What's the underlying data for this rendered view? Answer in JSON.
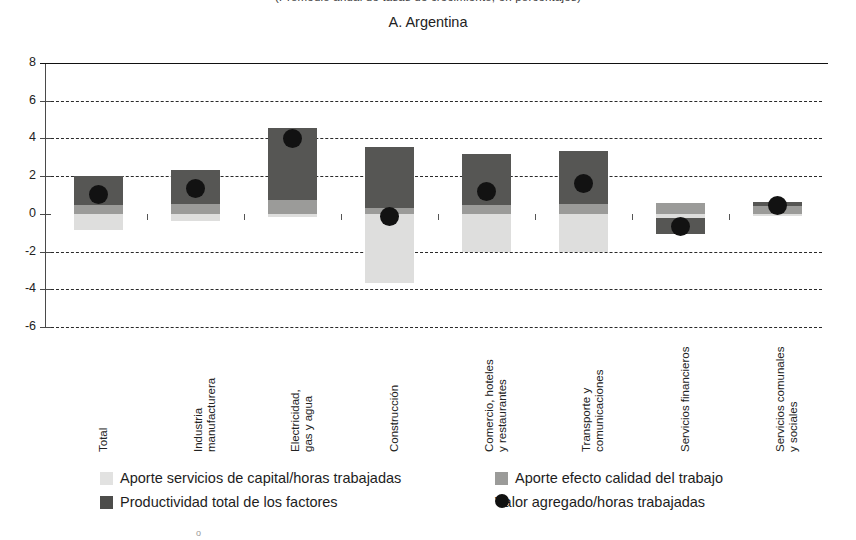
{
  "supertitle": "(Promedio anual de tasas de crecimiento, en porcentajes)",
  "panel_title": "A. Argentina",
  "axis": {
    "y_ticks": [
      "8",
      "6",
      "4",
      "2",
      "0",
      "-2",
      "-4",
      "-6"
    ],
    "y_min": -6,
    "y_max": 8,
    "y_step": 2
  },
  "legend": {
    "cap": "Aporte servicios de capital/horas trabajadas",
    "qual": "Aporte efecto calidad del trabajo",
    "tfp": "Productividad total de los factores",
    "dot": "Valor agregado/horas trabajadas"
  },
  "footmark": "o",
  "chart_data": {
    "type": "bar",
    "title": "A. Argentina",
    "subtitle": "(Promedio anual de tasas de crecimiento, en porcentajes)",
    "xlabel": "",
    "ylabel": "",
    "ylim": [
      -6,
      8
    ],
    "ytick_step": 2,
    "grid": true,
    "grid_style": "dashed horizontal",
    "legend_position": "bottom",
    "stacked": true,
    "categories": [
      "Total",
      "Industria manufacturera",
      "Electricidad, gas y agua",
      "Construcción",
      "Comercio, hoteles y restaurantes",
      "Transporte y comunicaciones",
      "Servicios financieros",
      "Servicios comunales y sociales"
    ],
    "category_lines": [
      [
        "Total"
      ],
      [
        "Industria",
        "manufacturera"
      ],
      [
        "Electricidad,",
        "gas y agua"
      ],
      [
        "Construcción"
      ],
      [
        "Comercio, hoteles",
        "y restaurantes"
      ],
      [
        "Transporte y",
        "comunicaciones"
      ],
      [
        "Servicios financieros"
      ],
      [
        "Servicios comunales",
        "y sociales"
      ]
    ],
    "series": [
      {
        "name": "Aporte servicios de capital/horas trabajadas",
        "color": "#dededd",
        "values": [
          -0.85,
          -0.4,
          -0.15,
          -3.65,
          -2.0,
          -2.0,
          -0.2,
          -0.1
        ]
      },
      {
        "name": "Aporte efecto calidad del trabajo",
        "color": "#9b9b99",
        "values": [
          0.45,
          0.5,
          0.75,
          0.3,
          0.45,
          0.5,
          0.55,
          0.4
        ]
      },
      {
        "name": "Productividad total de los factores",
        "color": "#565654",
        "values": [
          1.55,
          1.85,
          3.8,
          3.25,
          2.7,
          2.85,
          -0.85,
          0.25
        ]
      }
    ],
    "markers": {
      "name": "Valor agregado/horas trabajadas",
      "color": "#111111",
      "shape": "circle",
      "values": [
        1.05,
        1.35,
        4.0,
        -0.15,
        1.2,
        1.6,
        -0.65,
        0.45
      ]
    }
  }
}
